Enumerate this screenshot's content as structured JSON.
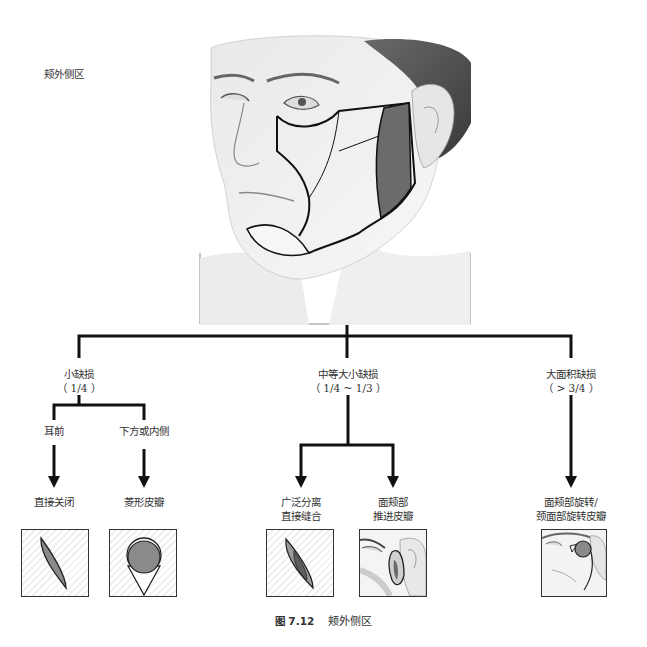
{
  "region_title": "颊外侧区",
  "main_figure": {
    "description": "Portrait illustration of a male face with outlined cheek subunits and shaded preauricular region",
    "highlight_color": "#6b6b6b"
  },
  "tree": {
    "branches": [
      {
        "label": "小缺损",
        "sublabel": "（ 1/4 ）",
        "children": [
          {
            "label": "耳前",
            "result": "直接关闭",
            "thumb": "ellipse-defect"
          },
          {
            "label": "下方或内侧",
            "result": "菱形皮瓣",
            "thumb": "rhombic-flap"
          }
        ]
      },
      {
        "label": "中等大小缺损",
        "sublabel": "（ 1/4 ~ 1/3 ）",
        "children": [
          {
            "label": "",
            "result_line1": "广泛分离",
            "result_line2": "直接缝合",
            "thumb": "wide-undermining"
          },
          {
            "label": "",
            "result_line1": "面颊部",
            "result_line2": "推进皮瓣",
            "thumb": "cheek-advancement"
          }
        ]
      },
      {
        "label": "大面积缺损",
        "sublabel": "（ > 3/4 ）",
        "children": [
          {
            "label": "",
            "result_line1": "面颊部旋转/",
            "result_line2": "颈面部旋转皮瓣",
            "thumb": "cervicofacial-rotation"
          }
        ]
      }
    ]
  },
  "caption": {
    "figure_number": "图 7.12",
    "title": "颊外侧区"
  },
  "colors": {
    "line": "#111111",
    "shade": "#8a8a8a",
    "dark_shade": "#666666"
  }
}
